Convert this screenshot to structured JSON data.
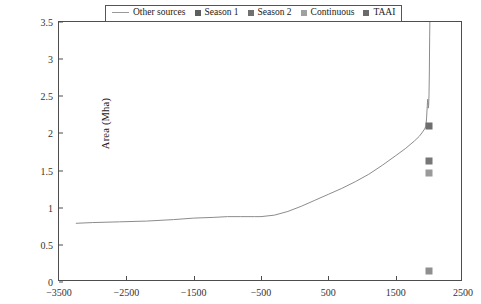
{
  "chart_data": {
    "type": "line",
    "title": "",
    "xlabel": "",
    "ylabel": "Area (Mha)",
    "xlim": [
      -3500,
      2500
    ],
    "ylim": [
      0,
      3.5
    ],
    "grid": false,
    "legend_position": "top-center",
    "xticks": [
      "-3500",
      "-2500",
      "-1500",
      "-500",
      "500",
      "1500",
      "2500"
    ],
    "xtick_values": [
      -3500,
      -2500,
      -1500,
      -500,
      500,
      1500,
      2500
    ],
    "yticks": [
      "0",
      "0.5",
      "1",
      "1.5",
      "2",
      "2.5",
      "3",
      "3.5"
    ],
    "ytick_values": [
      0,
      0.5,
      1,
      1.5,
      2,
      2.5,
      3,
      3.5
    ],
    "series": [
      {
        "name": "Other sources",
        "type": "line",
        "color": "#8c8c8c",
        "x": [
          -3250,
          -3000,
          -2600,
          -2200,
          -1800,
          -1500,
          -1200,
          -1000,
          -800,
          -600,
          -500,
          -300,
          -100,
          100,
          300,
          500,
          700,
          900,
          1100,
          1300,
          1500,
          1650,
          1780,
          1850,
          1900,
          1930,
          1950,
          1960,
          1970,
          1975,
          1980,
          1985,
          1990,
          1995,
          2000,
          2005,
          2008
        ],
        "y": [
          0.79,
          0.8,
          0.81,
          0.82,
          0.84,
          0.86,
          0.87,
          0.88,
          0.88,
          0.88,
          0.88,
          0.9,
          0.95,
          1.02,
          1.1,
          1.18,
          1.26,
          1.35,
          1.45,
          1.57,
          1.7,
          1.8,
          1.9,
          1.96,
          2.02,
          2.06,
          2.1,
          2.22,
          2.38,
          2.46,
          2.42,
          2.34,
          2.38,
          2.52,
          2.8,
          3.3,
          3.5
        ]
      },
      {
        "name": "Season 1",
        "type": "scatter",
        "color": "#6e6e6e",
        "points": [
          {
            "x": 2000,
            "y": 2.1
          }
        ]
      },
      {
        "name": "Season 2",
        "type": "scatter",
        "color": "#777777",
        "points": [
          {
            "x": 2000,
            "y": 1.63
          }
        ]
      },
      {
        "name": "Continuous",
        "type": "scatter",
        "color": "#9a9a9a",
        "points": [
          {
            "x": 2000,
            "y": 1.47
          }
        ]
      },
      {
        "name": "TAAI",
        "type": "scatter",
        "color": "#8f8f8f",
        "points": [
          {
            "x": 2000,
            "y": 0.15
          }
        ]
      }
    ]
  },
  "legend": {
    "entries": [
      {
        "label": "Other sources",
        "marker": "line",
        "color": "#999999"
      },
      {
        "label": "Season 1",
        "marker": "square",
        "color": "#5e5e5e"
      },
      {
        "label": "Season 2",
        "marker": "square",
        "color": "#707070"
      },
      {
        "label": "Continuous",
        "marker": "square",
        "color": "#a0a0a0"
      },
      {
        "label": "TAAI",
        "marker": "square",
        "color": "#6a6a6a"
      }
    ]
  },
  "axes": {
    "frame_color": "#4d4d4d",
    "tick_color": "#333333"
  }
}
